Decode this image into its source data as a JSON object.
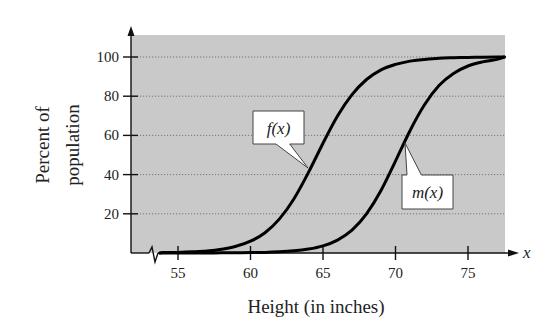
{
  "chart_data": {
    "type": "line",
    "title": "",
    "xlabel": "Height (in inches)",
    "ylabel": [
      "Percent of",
      "population"
    ],
    "x_axis_symbol": "x",
    "xlim": [
      53,
      77.5
    ],
    "ylim": [
      0,
      110
    ],
    "x_ticks": [
      55,
      60,
      65,
      70,
      75
    ],
    "y_ticks": [
      20,
      40,
      60,
      80,
      100
    ],
    "x_tick_labels": [
      "55",
      "60",
      "65",
      "70",
      "75"
    ],
    "y_tick_labels": [
      "20",
      "40",
      "60",
      "80",
      "100"
    ],
    "grid": {
      "horizontal": true,
      "style": "dotted"
    },
    "axis_break": true,
    "background": "#c9c9c9",
    "x": [
      54,
      55,
      56,
      57,
      58,
      59,
      60,
      61,
      62,
      63,
      64,
      65,
      66,
      67,
      68,
      69,
      70,
      71,
      72,
      73,
      74,
      75,
      76,
      77,
      77.5
    ],
    "series": [
      {
        "name": "f(x)",
        "label": "f(x)",
        "values": [
          0.2,
          0.3,
          0.6,
          1.0,
          1.9,
          3.4,
          6.0,
          10.3,
          17.4,
          27.7,
          41.1,
          56.0,
          69.9,
          80.8,
          88.5,
          93.4,
          96.2,
          97.9,
          98.8,
          99.4,
          99.6,
          99.8,
          99.9,
          100,
          100
        ]
      },
      {
        "name": "m(x)",
        "label": "m(x)",
        "values": [
          0.0,
          0.0,
          0.0,
          0.0,
          0.1,
          0.1,
          0.2,
          0.3,
          0.6,
          1.1,
          2.0,
          3.6,
          6.6,
          11.7,
          20.0,
          31.9,
          46.9,
          62.4,
          75.6,
          85.4,
          91.6,
          95.4,
          97.5,
          98.8,
          100
        ]
      }
    ],
    "annotations": [
      {
        "text": "f(x)",
        "box": [
          253,
          111,
          51,
          33
        ],
        "pointer_to": [
          308,
          168
        ]
      },
      {
        "text": "m(x)",
        "box": [
          402,
          175,
          51,
          34
        ],
        "pointer_to": [
          405,
          143
        ]
      }
    ]
  }
}
